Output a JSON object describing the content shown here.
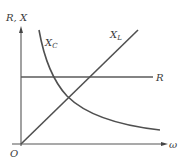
{
  "diagram": {
    "title": "",
    "axes": {
      "y_label": "R, X",
      "x_label": "ω",
      "origin_label": "O"
    },
    "curves": [
      {
        "name": "X_C",
        "label_main": "X",
        "label_sub": "C",
        "shape": "hyperbola (decreasing)"
      },
      {
        "name": "X_L",
        "label_main": "X",
        "label_sub": "L",
        "shape": "straight line through origin (increasing)"
      },
      {
        "name": "R",
        "label_main": "R",
        "label_sub": "",
        "shape": "horizontal line (constant)"
      }
    ],
    "colors": {
      "axis": "#555555",
      "curve": "#505050",
      "text": "#3a3a3a"
    }
  }
}
